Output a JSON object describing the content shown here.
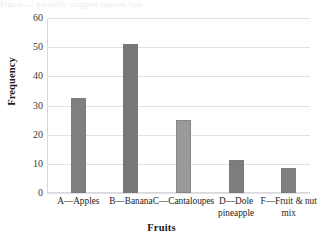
{
  "top_caption": "Figure — partially cropped caption line",
  "chart_data": {
    "type": "bar",
    "title": "",
    "xlabel": "Fruits",
    "ylabel": "Frequency",
    "categories": [
      "A—Apples",
      "B—Banana",
      "C—Cantaloupes",
      "D—Dole pineapple",
      "F—Fruit & nut mix"
    ],
    "category_lines": [
      [
        "A—Apples"
      ],
      [
        "B—Banana"
      ],
      [
        "C—Cantaloupes"
      ],
      [
        "D—Dole",
        "pineapple"
      ],
      [
        "F—Fruit & nut",
        "mix"
      ]
    ],
    "values": [
      32.5,
      51,
      25,
      11.5,
      8.5
    ],
    "bar_colors": [
      "#7f7f7f",
      "#787878",
      "#9a9a9a",
      "#7d7d7d",
      "#808080"
    ],
    "ylim": [
      0,
      60
    ],
    "yticks": [
      0,
      10,
      20,
      30,
      40,
      50,
      60
    ],
    "ytick_labels": [
      "0",
      "10",
      "20",
      "30",
      "40",
      "50",
      "60"
    ],
    "grid": true,
    "grid_color": "#e2e2e6",
    "legend": "none",
    "legend_position": "none",
    "background": "#ffffff"
  }
}
